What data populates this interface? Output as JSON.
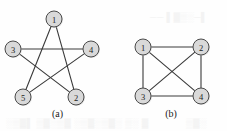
{
  "figure": {
    "background_color": "#fefefe",
    "line_color": "#3a3a3a",
    "node_fill_color": "#d9d9d9",
    "node_stroke_color": "#4a4a4a",
    "label_color": "#1c1c1c",
    "ghost_color": "#f3f3f3"
  },
  "panels": [
    {
      "id": "a",
      "caption": "(a)",
      "graph_name": "pentagram-graph",
      "node_radius": 8,
      "nodes": [
        {
          "id": "1",
          "label": "1",
          "cx": 54,
          "cy": 19
        },
        {
          "id": "2",
          "label": "2",
          "cx": 76,
          "cy": 97
        },
        {
          "id": "3",
          "label": "3",
          "cx": 13,
          "cy": 49
        },
        {
          "id": "4",
          "label": "4",
          "cx": 91,
          "cy": 49
        },
        {
          "id": "5",
          "label": "5",
          "cx": 23,
          "cy": 97
        }
      ],
      "edges": [
        {
          "from": "1",
          "to": "2"
        },
        {
          "from": "2",
          "to": "3"
        },
        {
          "from": "3",
          "to": "4"
        },
        {
          "from": "4",
          "to": "5"
        },
        {
          "from": "5",
          "to": "1"
        }
      ]
    },
    {
      "id": "b",
      "caption": "(b)",
      "graph_name": "complete-graph-k4",
      "node_radius": 8,
      "nodes": [
        {
          "id": "1",
          "label": "1",
          "cx": 28,
          "cy": 47
        },
        {
          "id": "2",
          "label": "2",
          "cx": 86,
          "cy": 47
        },
        {
          "id": "3",
          "label": "3",
          "cx": 28,
          "cy": 96
        },
        {
          "id": "4",
          "label": "4",
          "cx": 86,
          "cy": 96
        }
      ],
      "edges": [
        {
          "from": "1",
          "to": "2"
        },
        {
          "from": "1",
          "to": "3"
        },
        {
          "from": "3",
          "to": "4"
        },
        {
          "from": "2",
          "to": "4"
        },
        {
          "from": "1",
          "to": "4"
        },
        {
          "from": "2",
          "to": "3"
        }
      ]
    }
  ],
  "ghost_marks": [
    {
      "text": "── ▌▓▒░─▌",
      "x": 150,
      "y": 12
    },
    {
      "text": "░▒▓▌ ▒▓░▒▓  ░▒▓░▒▓░  ▒░ ▓",
      "x": 6,
      "y": 118
    },
    {
      "text": "▒▓░",
      "x": 186,
      "y": 118
    }
  ]
}
